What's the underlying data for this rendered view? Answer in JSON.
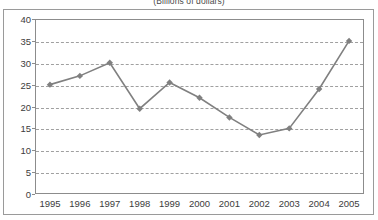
{
  "chart_data": {
    "type": "line",
    "title": "",
    "subtitle": "(Billions of dollars)",
    "xlabel": "",
    "ylabel": "",
    "categories": [
      "1995",
      "1996",
      "1997",
      "1998",
      "1999",
      "2000",
      "2001",
      "2002",
      "2003",
      "2004",
      "2005"
    ],
    "values": [
      25,
      27,
      30,
      19.5,
      25.5,
      22,
      17.5,
      13.5,
      15,
      24,
      35
    ],
    "series": [
      {
        "name": "",
        "values": [
          25,
          27,
          30,
          19.5,
          25.5,
          22,
          17.5,
          13.5,
          15,
          24,
          35
        ]
      }
    ],
    "ylim": [
      0,
      40
    ],
    "ytick_labels": [
      "0",
      "5",
      "10",
      "15",
      "20",
      "25",
      "30",
      "35",
      "40"
    ],
    "ytick_values": [
      0,
      5,
      10,
      15,
      20,
      25,
      30,
      35,
      40
    ],
    "grid": "horizontal-dashed",
    "legend": "none",
    "marker": "diamond",
    "line_color": "#808080",
    "marker_color": "#808080",
    "grid_color": "#a0a0a0",
    "axis_color": "#8c8c8c",
    "text_color": "#3c3c3c",
    "background_color": "#ffffff"
  }
}
